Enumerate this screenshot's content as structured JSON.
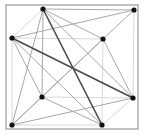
{
  "diagram": {
    "type": "graph",
    "frame": {
      "x": 6,
      "y": 5,
      "width": 132,
      "height": 124,
      "stroke": "#9a9a9a"
    },
    "nodes": [
      {
        "id": "A",
        "x": 43,
        "y": 9
      },
      {
        "id": "B",
        "x": 134,
        "y": 10
      },
      {
        "id": "C",
        "x": 12,
        "y": 38
      },
      {
        "id": "D",
        "x": 103,
        "y": 39
      },
      {
        "id": "E",
        "x": 42,
        "y": 97
      },
      {
        "id": "F",
        "x": 133,
        "y": 98
      },
      {
        "id": "G",
        "x": 12,
        "y": 125
      },
      {
        "id": "H",
        "x": 102,
        "y": 125
      }
    ],
    "edges": [
      {
        "from": "A",
        "to": "C",
        "weight": "light"
      },
      {
        "from": "C",
        "to": "D",
        "weight": "light"
      },
      {
        "from": "C",
        "to": "G",
        "weight": "light"
      },
      {
        "from": "D",
        "to": "H",
        "weight": "light"
      },
      {
        "from": "E",
        "to": "F",
        "weight": "light"
      },
      {
        "from": "B",
        "to": "F",
        "weight": "light"
      },
      {
        "from": "G",
        "to": "H",
        "weight": "light"
      },
      {
        "from": "H",
        "to": "F",
        "weight": "light"
      },
      {
        "from": "A",
        "to": "B",
        "weight": "medium"
      },
      {
        "from": "A",
        "to": "D",
        "weight": "medium"
      },
      {
        "from": "A",
        "to": "F",
        "weight": "medium"
      },
      {
        "from": "A",
        "to": "E",
        "weight": "medium"
      },
      {
        "from": "A",
        "to": "G",
        "weight": "medium"
      },
      {
        "from": "C",
        "to": "B",
        "weight": "medium"
      },
      {
        "from": "C",
        "to": "H",
        "weight": "medium"
      },
      {
        "from": "C",
        "to": "E",
        "weight": "medium"
      },
      {
        "from": "B",
        "to": "D",
        "weight": "medium"
      },
      {
        "from": "D",
        "to": "E",
        "weight": "medium"
      },
      {
        "from": "D",
        "to": "G",
        "weight": "medium"
      },
      {
        "from": "D",
        "to": "F",
        "weight": "medium"
      },
      {
        "from": "E",
        "to": "H",
        "weight": "medium"
      },
      {
        "from": "E",
        "to": "G",
        "weight": "medium"
      },
      {
        "from": "G",
        "to": "F",
        "weight": "medium"
      },
      {
        "from": "A",
        "to": "H",
        "weight": "dark"
      },
      {
        "from": "C",
        "to": "F",
        "weight": "dark"
      }
    ],
    "colors": {
      "light": "#d8d8d8",
      "medium": "#a8a8a8",
      "dark": "#4a4a4a",
      "node": "#111111"
    }
  }
}
